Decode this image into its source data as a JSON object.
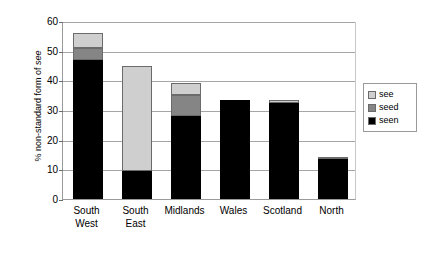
{
  "chart_data": {
    "type": "bar",
    "stacked": true,
    "title": "",
    "xlabel": "",
    "ylabel": "% non-standard form of see",
    "ylim": [
      0,
      60
    ],
    "yticks": [
      0,
      10,
      20,
      30,
      40,
      50,
      60
    ],
    "grid": true,
    "legend_position": "right",
    "categories": [
      "South West",
      "South East",
      "Midlands",
      "Wales",
      "Scotland",
      "North"
    ],
    "category_lines": [
      [
        "South",
        "West"
      ],
      [
        "South",
        "East"
      ],
      [
        "Midlands",
        ""
      ],
      [
        "Wales",
        ""
      ],
      [
        "Scotland",
        ""
      ],
      [
        "North",
        ""
      ]
    ],
    "series": [
      {
        "name": "seen",
        "color": "#000000",
        "values": [
          47.0,
          9.5,
          28.0,
          33.5,
          32.5,
          13.5
        ]
      },
      {
        "name": "seed",
        "color": "#858585",
        "values": [
          4.0,
          0.0,
          7.0,
          0.0,
          0.0,
          0.0
        ]
      },
      {
        "name": "see",
        "color": "#cfcfcf",
        "values": [
          5.0,
          35.5,
          4.0,
          0.0,
          1.0,
          0.7
        ]
      }
    ],
    "totals": [
      56.0,
      45.0,
      39.0,
      33.5,
      33.5,
      14.2
    ]
  },
  "legend": {
    "items": [
      {
        "label": "see",
        "color": "#cfcfcf"
      },
      {
        "label": "seed",
        "color": "#858585"
      },
      {
        "label": "seen",
        "color": "#000000"
      }
    ]
  },
  "axis": {
    "y_title_prefix": "% non-standard form of ",
    "y_title_italic": "see"
  }
}
